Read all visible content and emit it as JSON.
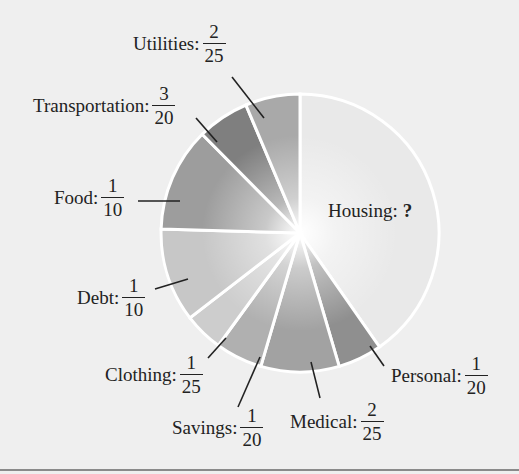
{
  "chart_data": {
    "type": "pie",
    "title": "",
    "slices": [
      {
        "name": "Housing",
        "value_label": "?",
        "value": 0.35,
        "color": "#e9e9e9"
      },
      {
        "name": "Personal",
        "value_label": "1/20",
        "numerator": "1",
        "denominator": "20",
        "value": 0.05,
        "color": "#8f8f8f"
      },
      {
        "name": "Medical",
        "value_label": "2/25",
        "numerator": "2",
        "denominator": "25",
        "value": 0.08,
        "color": "#a2a2a2"
      },
      {
        "name": "Savings",
        "value_label": "1/20",
        "numerator": "1",
        "denominator": "20",
        "value": 0.05,
        "color": "#b0b0b0"
      },
      {
        "name": "Clothing",
        "value_label": "1/25",
        "numerator": "1",
        "denominator": "25",
        "value": 0.04,
        "color": "#cdcdcd"
      },
      {
        "name": "Debt",
        "value_label": "1/10",
        "numerator": "1",
        "denominator": "10",
        "value": 0.1,
        "color": "#c7c7c7"
      },
      {
        "name": "Food",
        "value_label": "1/10",
        "numerator": "1",
        "denominator": "10",
        "value": 0.1,
        "color": "#9d9d9d"
      },
      {
        "name": "Transportation",
        "value_label": "3/20",
        "numerator": "3",
        "denominator": "20",
        "value": 0.15,
        "color": "#7f7f7f"
      },
      {
        "name": "Utilities",
        "value_label": "2/25",
        "numerator": "2",
        "denominator": "25",
        "value": 0.08,
        "color": "#a9a9a9"
      }
    ],
    "legend": "none (callout labels)",
    "note": "Housing fraction shown as '?' (unknown)"
  },
  "labels": {
    "utilities": {
      "name": "Utilities:",
      "num": "2",
      "den": "25"
    },
    "transportation": {
      "name": "Transportation:",
      "num": "3",
      "den": "20"
    },
    "food": {
      "name": "Food:",
      "num": "1",
      "den": "10"
    },
    "debt": {
      "name": "Debt:",
      "num": "1",
      "den": "10"
    },
    "clothing": {
      "name": "Clothing:",
      "num": "1",
      "den": "25"
    },
    "savings": {
      "name": "Savings:",
      "num": "1",
      "den": "20"
    },
    "medical": {
      "name": "Medical:",
      "num": "2",
      "den": "25"
    },
    "personal": {
      "name": "Personal:",
      "num": "1",
      "den": "20"
    },
    "housing": {
      "name": "Housing:",
      "value": "?"
    }
  }
}
